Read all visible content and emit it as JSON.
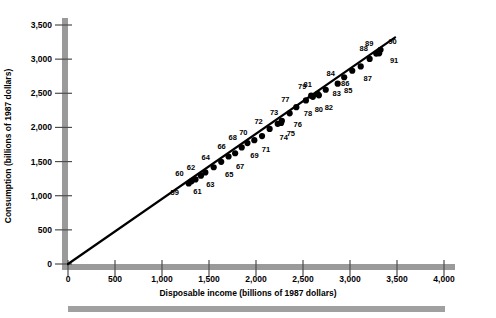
{
  "chart_data": {
    "type": "scatter",
    "title": "",
    "xlabel": "Disposable income (billions of 1987 dollars)",
    "ylabel": "Consumption (billions of 1987 dollars)",
    "xlim": [
      0,
      4000
    ],
    "ylim": [
      0,
      3500
    ],
    "xticks": [
      0,
      500,
      1000,
      1500,
      2000,
      2500,
      3000,
      3500,
      4000
    ],
    "xtick_labels": [
      "0",
      "500",
      "1,000",
      "1,500",
      "2,000",
      "2,500",
      "3,000",
      "3,500",
      "4,000"
    ],
    "yticks": [
      0,
      500,
      1000,
      1500,
      2000,
      2500,
      3000,
      3500
    ],
    "ytick_labels": [
      "0",
      "500",
      "1,000",
      "1,500",
      "2,000",
      "2,500",
      "3,000",
      "3,500"
    ],
    "grid": false,
    "legend": false,
    "marker": "filled-circle",
    "marker_color": "#000000",
    "trendline": {
      "visible": true,
      "color": "#000000",
      "x0": 0,
      "y0": 0,
      "x1": 3480,
      "y1": 3320
    },
    "points": [
      {
        "label": "59",
        "x": 1284,
        "y": 1179,
        "lx": -14,
        "ly": 9
      },
      {
        "label": "60",
        "x": 1313,
        "y": 1210,
        "lx": -12,
        "ly": -8
      },
      {
        "label": "61",
        "x": 1356,
        "y": 1238,
        "lx": 2,
        "ly": 12
      },
      {
        "label": "62",
        "x": 1414,
        "y": 1293,
        "lx": -10,
        "ly": -9
      },
      {
        "label": "63",
        "x": 1461,
        "y": 1341,
        "lx": 5,
        "ly": 12
      },
      {
        "label": "64",
        "x": 1550,
        "y": 1417,
        "lx": -8,
        "ly": -10
      },
      {
        "label": "65",
        "x": 1630,
        "y": 1497,
        "lx": 8,
        "ly": 12
      },
      {
        "label": "66",
        "x": 1708,
        "y": 1574,
        "lx": -7,
        "ly": -11
      },
      {
        "label": "67",
        "x": 1778,
        "y": 1622,
        "lx": 5,
        "ly": 13
      },
      {
        "label": "68",
        "x": 1848,
        "y": 1707,
        "lx": -9,
        "ly": -10
      },
      {
        "label": "69",
        "x": 1909,
        "y": 1771,
        "lx": 7,
        "ly": 12
      },
      {
        "label": "70",
        "x": 1982,
        "y": 1814,
        "lx": -11,
        "ly": -8
      },
      {
        "label": "71",
        "x": 2064,
        "y": 1874,
        "lx": 4,
        "ly": 13
      },
      {
        "label": "72",
        "x": 2145,
        "y": 1978,
        "lx": -11,
        "ly": -8
      },
      {
        "label": "73",
        "x": 2267,
        "y": 2066,
        "lx": -7,
        "ly": -11
      },
      {
        "label": "74",
        "x": 2231,
        "y": 2053,
        "lx": 6,
        "ly": 13
      },
      {
        "label": "75",
        "x": 2275,
        "y": 2098,
        "lx": 9,
        "ly": 12
      },
      {
        "label": "76",
        "x": 2358,
        "y": 2207,
        "lx": 8,
        "ly": 11
      },
      {
        "label": "77",
        "x": 2429,
        "y": 2297,
        "lx": -11,
        "ly": -8
      },
      {
        "label": "78",
        "x": 2531,
        "y": 2395,
        "lx": 2,
        "ly": 13
      },
      {
        "label": "79",
        "x": 2587,
        "y": 2465,
        "lx": -9,
        "ly": -10
      },
      {
        "label": "80",
        "x": 2605,
        "y": 2448,
        "lx": 6,
        "ly": 12
      },
      {
        "label": "81",
        "x": 2656,
        "y": 2490,
        "lx": -10,
        "ly": -10
      },
      {
        "label": "82",
        "x": 2669,
        "y": 2470,
        "lx": 10,
        "ly": 12
      },
      {
        "label": "83",
        "x": 2742,
        "y": 2552,
        "lx": 11,
        "ly": 3
      },
      {
        "label": "84",
        "x": 2869,
        "y": 2641,
        "lx": -7,
        "ly": -11
      },
      {
        "label": "85",
        "x": 2938,
        "y": 2735,
        "lx": 4,
        "ly": 13
      },
      {
        "label": "86",
        "x": 3024,
        "y": 2830,
        "lx": -7,
        "ly": 12
      },
      {
        "label": "87",
        "x": 3114,
        "y": 2893,
        "lx": 7,
        "ly": 12
      },
      {
        "label": "88",
        "x": 3209,
        "y": 3003,
        "lx": -6,
        "ly": -11
      },
      {
        "label": "89",
        "x": 3279,
        "y": 3081,
        "lx": -7,
        "ly": -11
      },
      {
        "label": "90",
        "x": 3325,
        "y": 3136,
        "lx": 12,
        "ly": -9
      },
      {
        "label": "91",
        "x": 3310,
        "y": 3085,
        "lx": 15,
        "ly": 7
      }
    ]
  },
  "decor": {
    "bottom_bar_color": "#a0a0a0",
    "axis_bar_color": "#9a9a9a",
    "tick_color": "#4d4d4d"
  }
}
